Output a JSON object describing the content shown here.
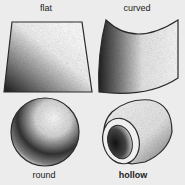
{
  "figure": {
    "shapes": [
      {
        "id": "flat",
        "label": "flat"
      },
      {
        "id": "curved",
        "label": "curved"
      },
      {
        "id": "round",
        "label": "round"
      },
      {
        "id": "hollow",
        "label": "hollow"
      }
    ]
  },
  "colors": {
    "background": "#ececec",
    "outline": "#2a2a2a",
    "shade_dark": "#1a1a1a",
    "shade_light": "#ffffff"
  }
}
